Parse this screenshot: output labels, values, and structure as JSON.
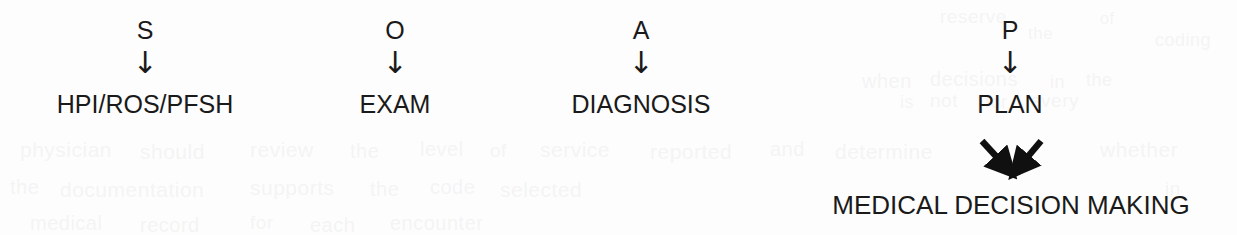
{
  "diagram": {
    "type": "soap-note-flow",
    "background_color": "#fdfdfd",
    "text_color": "#1a1a1a",
    "arrow_glyph": "↓",
    "columns": [
      {
        "id": "subjective",
        "letter": "S",
        "arrow": "↓",
        "label": "HPI/ROS/PFSH",
        "center_x": 145
      },
      {
        "id": "objective",
        "letter": "O",
        "arrow": "↓",
        "label": "EXAM",
        "center_x": 395
      },
      {
        "id": "assessment",
        "letter": "A",
        "arrow": "↓",
        "label": "DIAGNOSIS",
        "center_x": 641
      },
      {
        "id": "plan",
        "letter": "P",
        "arrow": "↓",
        "label": "PLAN",
        "center_x": 1010
      }
    ],
    "converging_arrows": {
      "count": 2,
      "left_arrow_direction": "down-right",
      "right_arrow_direction": "down-left",
      "target": "MEDICAL DECISION MAKING"
    },
    "conclusion": {
      "label": "MEDICAL DECISION MAKING",
      "center_x": 1011
    },
    "bleed_through": [
      {
        "text": "reserve",
        "x": 940,
        "y": 6,
        "size": 19
      },
      {
        "text": "the",
        "x": 1028,
        "y": 24,
        "size": 17
      },
      {
        "text": "of",
        "x": 1100,
        "y": 10,
        "size": 16
      },
      {
        "text": "coding",
        "x": 1155,
        "y": 30,
        "size": 18
      },
      {
        "text": "when",
        "x": 862,
        "y": 70,
        "size": 20
      },
      {
        "text": "decisions",
        "x": 930,
        "y": 68,
        "size": 20
      },
      {
        "text": "in",
        "x": 1050,
        "y": 72,
        "size": 18
      },
      {
        "text": "the",
        "x": 1086,
        "y": 70,
        "size": 18
      },
      {
        "text": "is",
        "x": 900,
        "y": 92,
        "size": 18
      },
      {
        "text": "not",
        "x": 930,
        "y": 90,
        "size": 19
      },
      {
        "text": "for",
        "x": 985,
        "y": 92,
        "size": 18
      },
      {
        "text": "every",
        "x": 1030,
        "y": 90,
        "size": 19
      },
      {
        "text": "physician",
        "x": 20,
        "y": 138,
        "size": 21
      },
      {
        "text": "should",
        "x": 140,
        "y": 140,
        "size": 21
      },
      {
        "text": "review",
        "x": 250,
        "y": 138,
        "size": 21
      },
      {
        "text": "the",
        "x": 350,
        "y": 140,
        "size": 20
      },
      {
        "text": "level",
        "x": 420,
        "y": 138,
        "size": 20
      },
      {
        "text": "of",
        "x": 490,
        "y": 140,
        "size": 19
      },
      {
        "text": "service",
        "x": 540,
        "y": 138,
        "size": 21
      },
      {
        "text": "reported",
        "x": 650,
        "y": 140,
        "size": 21
      },
      {
        "text": "and",
        "x": 770,
        "y": 138,
        "size": 20
      },
      {
        "text": "determine",
        "x": 835,
        "y": 140,
        "size": 21
      },
      {
        "text": "whether",
        "x": 1100,
        "y": 138,
        "size": 21
      },
      {
        "text": "the",
        "x": 10,
        "y": 176,
        "size": 20
      },
      {
        "text": "documentation",
        "x": 60,
        "y": 178,
        "size": 21
      },
      {
        "text": "supports",
        "x": 250,
        "y": 176,
        "size": 21
      },
      {
        "text": "the",
        "x": 370,
        "y": 178,
        "size": 20
      },
      {
        "text": "code",
        "x": 430,
        "y": 176,
        "size": 20
      },
      {
        "text": "selected",
        "x": 500,
        "y": 178,
        "size": 21
      },
      {
        "text": "in",
        "x": 1165,
        "y": 178,
        "size": 19
      },
      {
        "text": "medical",
        "x": 30,
        "y": 212,
        "size": 20
      },
      {
        "text": "record",
        "x": 140,
        "y": 214,
        "size": 20
      },
      {
        "text": "for",
        "x": 250,
        "y": 212,
        "size": 19
      },
      {
        "text": "each",
        "x": 310,
        "y": 214,
        "size": 20
      },
      {
        "text": "encounter",
        "x": 390,
        "y": 212,
        "size": 20
      }
    ]
  }
}
